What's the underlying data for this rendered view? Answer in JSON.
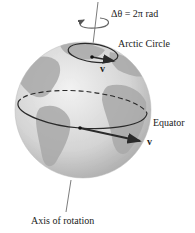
{
  "diagram": {
    "labels": {
      "rotation_angle": "Δθ = 2π rad",
      "arctic_circle": "Arctic Circle",
      "equator": "Equator",
      "axis": "Axis of rotation",
      "velocity_arctic": "v⃗",
      "velocity_equator": "v⃗"
    },
    "colors": {
      "globe_light": "#e6e6e6",
      "globe_dark": "#9a9a9a",
      "land": "#a8a8a8",
      "line": "#2a2a2a"
    }
  }
}
